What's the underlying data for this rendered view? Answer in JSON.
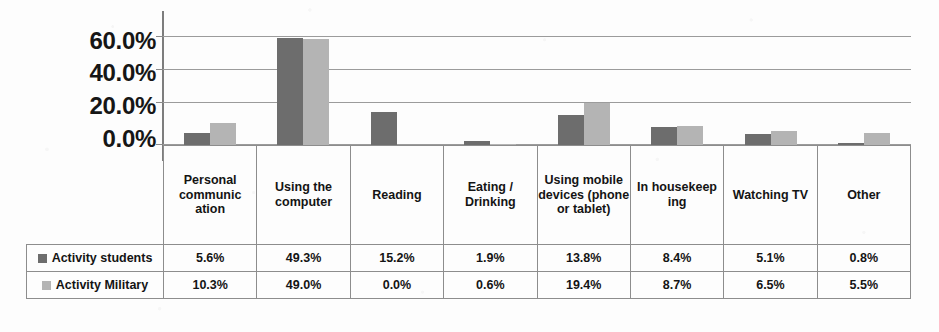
{
  "chart_data": {
    "type": "bar",
    "title": "",
    "subtitle": "",
    "xlabel": "",
    "ylabel": "",
    "ylim": [
      0,
      60
    ],
    "grid": true,
    "legend_position": "table-row-headers",
    "y_ticks": [
      "0.0%",
      "20.0%",
      "40.0%",
      "60.0%"
    ],
    "y_tick_values": [
      0,
      20,
      40,
      60
    ],
    "categories": [
      "Personal communic ation",
      "Using the computer",
      "Reading",
      "Eating / Drinking",
      "Using mobile devices (phone or tablet)",
      "In housekeep ing",
      "Watching TV",
      "Other"
    ],
    "series": [
      {
        "name": "Activity students",
        "color": "#6d6d6d",
        "values": [
          5.6,
          49.3,
          15.2,
          1.9,
          13.8,
          8.4,
          5.1,
          0.8
        ],
        "labels": [
          "5.6%",
          "49.3%",
          "15.2%",
          "1.9%",
          "13.8%",
          "8.4%",
          "5.1%",
          "0.8%"
        ]
      },
      {
        "name": "Activity Military",
        "color": "#b4b4b4",
        "values": [
          10.3,
          49.0,
          0.0,
          0.6,
          19.4,
          8.7,
          6.5,
          5.5
        ],
        "labels": [
          "10.3%",
          "49.0%",
          "0.0%",
          "0.6%",
          "19.4%",
          "8.7%",
          "6.5%",
          "5.5%"
        ]
      }
    ]
  },
  "colors": {
    "series_students": "#6d6d6d",
    "series_military": "#b4b4b4",
    "gridline": "#9b9b9b",
    "table_border": "#8d8d8d",
    "background": "#fdfdfd"
  }
}
